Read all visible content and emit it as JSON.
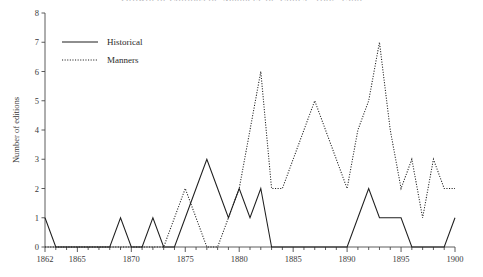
{
  "chart_data": {
    "type": "line",
    "title": "Growth of Editions of 'Manners' or 'Ethics', 1862-1900",
    "xlabel": "",
    "ylabel": "Number of editions",
    "xlim": [
      1862,
      1900
    ],
    "ylim": [
      0,
      8
    ],
    "y_ticks": [
      0,
      1,
      2,
      3,
      4,
      5,
      6,
      7,
      8
    ],
    "x_tick_labels": [
      "1862",
      "1865",
      "1870",
      "1875",
      "1880",
      "1885",
      "1890",
      "1895",
      "1900"
    ],
    "x_tick_values": [
      1862,
      1865,
      1870,
      1875,
      1880,
      1885,
      1890,
      1895,
      1900
    ],
    "x_minor_ticks": [
      1863,
      1864,
      1866,
      1867,
      1868,
      1869,
      1871,
      1872,
      1873,
      1874,
      1876,
      1877,
      1878,
      1879,
      1881,
      1882,
      1883,
      1884,
      1886,
      1887,
      1888,
      1889,
      1891,
      1892,
      1893,
      1894,
      1896,
      1897,
      1898,
      1899
    ],
    "grid": false,
    "legend_position": "top-left",
    "x": [
      1862,
      1863,
      1864,
      1865,
      1866,
      1867,
      1868,
      1869,
      1870,
      1871,
      1872,
      1873,
      1874,
      1875,
      1876,
      1877,
      1878,
      1879,
      1880,
      1881,
      1882,
      1883,
      1884,
      1885,
      1886,
      1887,
      1888,
      1889,
      1890,
      1891,
      1892,
      1893,
      1894,
      1895,
      1896,
      1897,
      1898,
      1899,
      1900
    ],
    "series": [
      {
        "name": "Historical",
        "style": "solid",
        "color": "#1f1f1f",
        "values": [
          1,
          0,
          0,
          0,
          0,
          0,
          0,
          1,
          0,
          0,
          1,
          0,
          0,
          1,
          2,
          3,
          2,
          1,
          2,
          1,
          2,
          0,
          0,
          0,
          0,
          0,
          0,
          0,
          0,
          1,
          2,
          1,
          1,
          1,
          0,
          0,
          0,
          0,
          1
        ]
      },
      {
        "name": "Manners",
        "style": "dotted",
        "color": "#1f1f1f",
        "values": [
          0,
          0,
          0,
          0,
          0,
          0,
          0,
          0,
          0,
          0,
          0,
          0,
          1,
          2,
          1,
          0,
          0,
          1,
          2,
          4,
          6,
          2,
          2,
          3,
          4,
          5,
          4,
          3,
          2,
          4,
          5,
          7,
          4,
          2,
          3,
          1,
          3,
          2,
          2
        ]
      }
    ]
  },
  "legend": {
    "items": [
      {
        "label": "Historical",
        "style": "solid"
      },
      {
        "label": "Manners",
        "style": "dotted"
      }
    ]
  }
}
